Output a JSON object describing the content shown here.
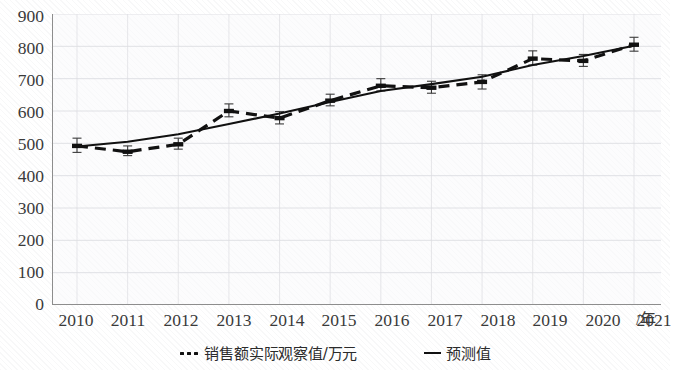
{
  "chart_data": {
    "type": "line",
    "title": "",
    "xlabel": "/年",
    "ylabel": "",
    "x": [
      2010,
      2011,
      2012,
      2013,
      2014,
      2015,
      2016,
      2017,
      2018,
      2019,
      2020,
      2021
    ],
    "categories": [
      "2010",
      "2011",
      "2012",
      "2013",
      "2014",
      "2015",
      "2016",
      "2017",
      "2018",
      "2019",
      "2020",
      "2021"
    ],
    "ylim": [
      0,
      900
    ],
    "yticks": [
      0,
      100,
      200,
      300,
      400,
      500,
      600,
      700,
      800,
      900
    ],
    "ytick_labels": [
      "0",
      "100",
      "200",
      "300",
      "400",
      "500",
      "600",
      "700",
      "800",
      "900"
    ],
    "grid": true,
    "legend_position": "bottom",
    "series": [
      {
        "name": "销售额实际观察值/万元",
        "style": "dashed",
        "marker": "point-with-error-bars",
        "color": "#111111",
        "values": [
          492,
          474,
          497,
          600,
          578,
          632,
          678,
          672,
          690,
          762,
          755,
          805
        ],
        "error_low": [
          472,
          462,
          482,
          582,
          560,
          616,
          662,
          655,
          668,
          742,
          738,
          785
        ],
        "error_high": [
          516,
          492,
          516,
          622,
          598,
          652,
          700,
          692,
          712,
          786,
          775,
          828
        ]
      },
      {
        "name": "预测值",
        "style": "solid",
        "color": "#111111",
        "values": [
          490,
          505,
          528,
          560,
          592,
          628,
          662,
          683,
          706,
          742,
          770,
          802
        ]
      }
    ]
  },
  "legend": {
    "items": [
      {
        "marker": "dotted",
        "label": "销售额实际观察值/万元"
      },
      {
        "marker": "line",
        "label": "预测值"
      }
    ]
  },
  "axis": {
    "x_unit_label": "/年"
  }
}
